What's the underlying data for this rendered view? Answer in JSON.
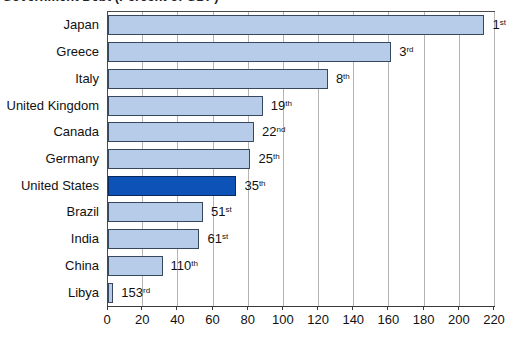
{
  "title": "Government Debt (Percent of GDP)",
  "colors": {
    "bar_fill": "#b7cce9",
    "bar_border": "#37485e",
    "highlight_fill": "#0d52b6",
    "highlight_border": "#0a2a5c",
    "gridline": "#b4b4b4",
    "axis": "#3a3a3a",
    "text": "#111111"
  },
  "chart_data": {
    "type": "bar",
    "orientation": "horizontal",
    "title": "Government Debt (Percent of GDP)",
    "categories": [
      "Japan",
      "Greece",
      "Italy",
      "United Kingdom",
      "Canada",
      "Germany",
      "United States",
      "Brazil",
      "India",
      "China",
      "Libya"
    ],
    "values": [
      214,
      161,
      125,
      88,
      83,
      81,
      73,
      54,
      52,
      31,
      3
    ],
    "rank_labels": [
      {
        "n": "1",
        "s": "st"
      },
      {
        "n": "3",
        "s": "rd"
      },
      {
        "n": "8",
        "s": "th"
      },
      {
        "n": "19",
        "s": "th"
      },
      {
        "n": "22",
        "s": "nd"
      },
      {
        "n": "25",
        "s": "th"
      },
      {
        "n": "35",
        "s": "th"
      },
      {
        "n": "51",
        "s": "st"
      },
      {
        "n": "61",
        "s": "st"
      },
      {
        "n": "110",
        "s": "th"
      },
      {
        "n": "153",
        "s": "rd"
      }
    ],
    "highlight_category": "United States",
    "xlabel": "",
    "ylabel": "",
    "xlim": [
      0,
      220
    ],
    "x_ticks": [
      0,
      20,
      40,
      60,
      80,
      100,
      120,
      140,
      160,
      180,
      200,
      220
    ],
    "grid": true,
    "legend": false
  }
}
